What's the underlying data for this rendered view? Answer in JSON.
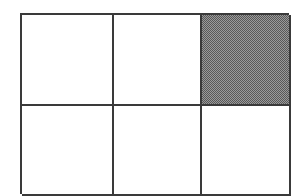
{
  "figure": {
    "columns": 3,
    "rows": 2,
    "line_color": "#3a3a3a",
    "line_width_px": 2,
    "background_color": "#ffffff",
    "shade_fill": {
      "pattern": "checkerboard-dither-50",
      "dark_color": "#585858",
      "light_color": "#9a9a9a",
      "effective_color": "#7b7b7b"
    },
    "cells": [
      {
        "id": "r1c1",
        "row": 1,
        "col": 1,
        "state": "empty",
        "label": ""
      },
      {
        "id": "r1c2",
        "row": 1,
        "col": 2,
        "state": "empty",
        "label": ""
      },
      {
        "id": "r1c3",
        "row": 1,
        "col": 3,
        "state": "shaded",
        "label": ""
      },
      {
        "id": "r2c1",
        "row": 2,
        "col": 1,
        "state": "empty",
        "label": ""
      },
      {
        "id": "r2c2",
        "row": 2,
        "col": 2,
        "state": "empty",
        "label": ""
      },
      {
        "id": "r2c3",
        "row": 2,
        "col": 3,
        "state": "empty",
        "label": ""
      }
    ],
    "shaded_count": 1,
    "total_count": 6,
    "fraction_shaded": "1/6"
  }
}
